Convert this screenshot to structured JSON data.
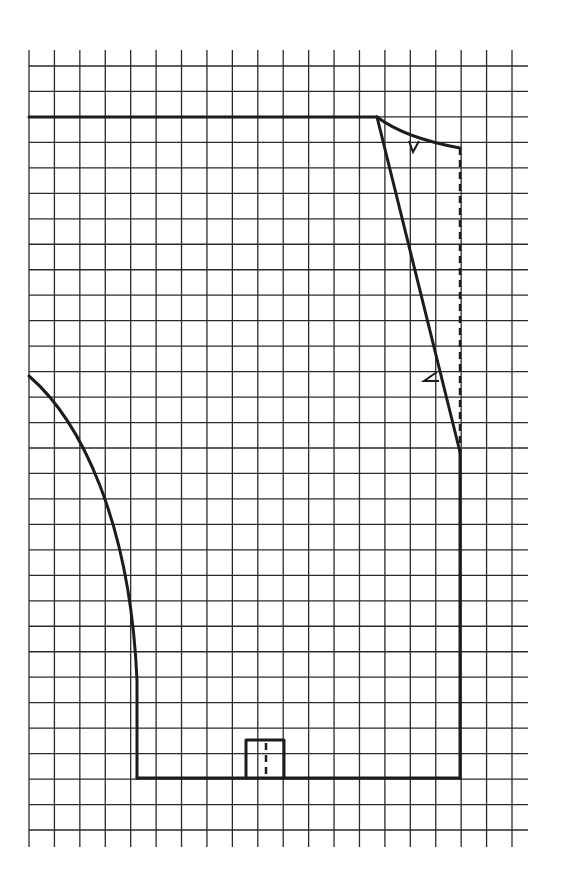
{
  "diagram": {
    "type": "sewing-pattern-draft",
    "grid": {
      "columns": 19,
      "rows": 30,
      "line_color": "#2a2a2a"
    },
    "pattern": {
      "outline_color": "#1c1c1c",
      "elements": [
        "top-line",
        "neckline-curve",
        "shoulder-dart-notch",
        "shoulder-slant-line",
        "front-edge-notch",
        "center-fold-dashed-line",
        "side-seam",
        "hem-line",
        "armhole-curve",
        "pocket-or-vent-box",
        "vent-dashed-line"
      ]
    }
  }
}
